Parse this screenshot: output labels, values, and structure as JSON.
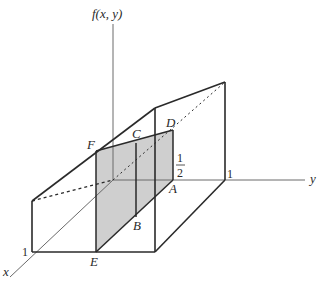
{
  "diagram": {
    "axes": {
      "vertical_label": "f(x, y)",
      "y_label": "y",
      "x_label": "x"
    },
    "ticks": {
      "y_one": "1",
      "x_one": "1",
      "half_num": "1",
      "half_den": "2"
    },
    "points": {
      "A": "A",
      "B": "B",
      "C": "C",
      "D": "D",
      "E": "E",
      "F": "F"
    },
    "colors": {
      "line": "#2a2a2a",
      "shade": "#cfcfcf",
      "axis": "#6a6a6a"
    }
  }
}
